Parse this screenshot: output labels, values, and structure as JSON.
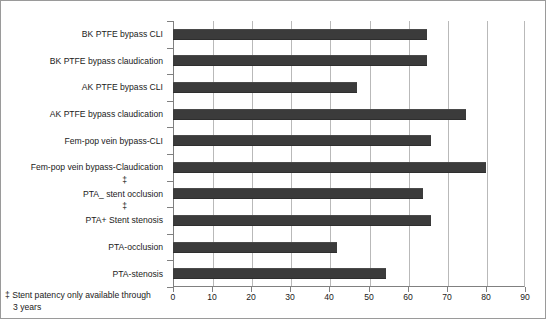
{
  "chart_data": {
    "type": "bar",
    "orientation": "horizontal",
    "title": "",
    "subtitle": "",
    "xlabel": "",
    "ylabel": "",
    "xlim": [
      0,
      90
    ],
    "ylim": null,
    "xticks": [
      0,
      10,
      20,
      30,
      40,
      50,
      60,
      70,
      80,
      90
    ],
    "xtick_labels": [
      "0",
      "10",
      "20",
      "30",
      "40",
      "50",
      "60",
      "70",
      "80",
      "90"
    ],
    "grid": "vertical",
    "legend": null,
    "legend_position": "none",
    "series_color": "#3b3b3b",
    "gridline_color": "#b9b9b9",
    "axis_color": "#808080",
    "categories": [
      "BK PTFE bypass CLI",
      "BK PTFE bypass claudication",
      "AK PTFE bypass CLI",
      "AK PTFE bypass claudication",
      "Fem-pop vein bypass-CLI",
      "Fem-pop vein bypass-Claudication",
      "PTA_ stent occlusion",
      "PTA+ Stent stenosis",
      "PTA-occlusion",
      "PTA-stenosis"
    ],
    "values": [
      65,
      65,
      47,
      75,
      66,
      80,
      64,
      66,
      42,
      54.5
    ],
    "annotations": [
      {
        "symbol": "‡",
        "category": "PTA_ stent occlusion"
      },
      {
        "symbol": "‡",
        "category": "PTA+ Stent stenosis"
      }
    ],
    "footnote": "‡ Stent patency only available through 3 years"
  },
  "bars": [
    {
      "label": "BK PTFE bypass CLI",
      "value": 65,
      "dagger": ""
    },
    {
      "label": "BK PTFE bypass claudication",
      "value": 65,
      "dagger": ""
    },
    {
      "label": "AK PTFE bypass CLI",
      "value": 47,
      "dagger": ""
    },
    {
      "label": "AK PTFE bypass claudication",
      "value": 75,
      "dagger": ""
    },
    {
      "label": "Fem-pop vein bypass-CLI",
      "value": 66,
      "dagger": ""
    },
    {
      "label": "Fem-pop vein bypass-Claudication",
      "value": 80,
      "dagger": ""
    },
    {
      "label": "PTA_ stent occlusion",
      "value": 64,
      "dagger": "‡"
    },
    {
      "label": "PTA+ Stent stenosis",
      "value": 66,
      "dagger": "‡"
    },
    {
      "label": "PTA-occlusion",
      "value": 42,
      "dagger": ""
    },
    {
      "label": "PTA-stenosis",
      "value": 54.5,
      "dagger": ""
    }
  ],
  "footnote": {
    "line1": "‡ Stent patency only available through",
    "line2": "3 years"
  }
}
